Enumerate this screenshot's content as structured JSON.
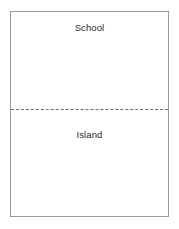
{
  "diagram": {
    "type": "two-region-boundary-diagram",
    "frame": {
      "border_color": "#9a9a9a",
      "background_color": "#ffffff"
    },
    "divider": {
      "style": "dashed",
      "color": "#6d6d6d",
      "orientation": "horizontal"
    },
    "regions": [
      {
        "id": "school",
        "label": "School",
        "position": "top"
      },
      {
        "id": "island",
        "label": "Island",
        "position": "bottom"
      }
    ],
    "text_color": "#2b2b2b"
  }
}
